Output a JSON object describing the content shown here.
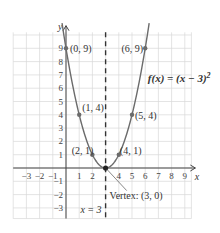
{
  "chart_data": {
    "type": "line",
    "function_label": "f(x) = (x − 3)",
    "function_exponent": "2",
    "xlabel": "x",
    "ylabel": "y",
    "xlim": [
      -4,
      9.8
    ],
    "ylim": [
      -3.8,
      10.6
    ],
    "grid": true,
    "x_ticks": [
      "−3",
      "−2",
      "−1",
      "1",
      "2",
      "4",
      "5",
      "6",
      "7",
      "8",
      "9"
    ],
    "x_tick_values": [
      -3,
      -2,
      -1,
      1,
      2,
      4,
      5,
      6,
      7,
      8,
      9
    ],
    "y_ticks": [
      "9",
      "8",
      "7",
      "6",
      "5",
      "4",
      "3",
      "2",
      "1",
      "−1",
      "−2",
      "−3"
    ],
    "y_tick_values": [
      9,
      8,
      7,
      6,
      5,
      4,
      3,
      2,
      1,
      -1,
      -2,
      -3
    ],
    "points": [
      {
        "x": 0,
        "y": 9,
        "label": "(0, 9)"
      },
      {
        "x": 1,
        "y": 4,
        "label": "(1, 4)"
      },
      {
        "x": 2,
        "y": 1,
        "label": "(2, 1)"
      },
      {
        "x": 3,
        "y": 0,
        "label": "Vertex: (3, 0)"
      },
      {
        "x": 4,
        "y": 1,
        "label": "(4, 1)"
      },
      {
        "x": 5,
        "y": 4,
        "label": "(5, 4)"
      },
      {
        "x": 6,
        "y": 9,
        "label": "(6, 9)"
      }
    ],
    "axis_of_symmetry": {
      "x": 3,
      "label": "x = 3",
      "style": "dashed"
    },
    "curve_color": "#6b6b6b",
    "point_color": "#6b6b6b",
    "grid_color": "#d8d8d8"
  }
}
